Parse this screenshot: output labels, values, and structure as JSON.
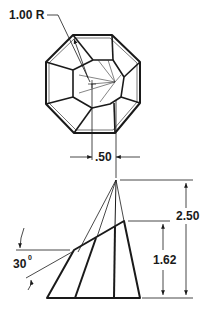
{
  "diagram": {
    "type": "technical-drawing",
    "top_view": {
      "shape": "truncated-octagonal-dome",
      "radius_label": "1.00 R",
      "offset_label": ".50"
    },
    "side_view": {
      "shape": "truncated-cone-section",
      "total_height_label": "2.50",
      "cut_height_label": "1.62",
      "angle_label": "30",
      "angle_unit": "0"
    },
    "colors": {
      "line": "#1a1a1a",
      "thin_line": "#333333",
      "background": "#ffffff"
    }
  }
}
